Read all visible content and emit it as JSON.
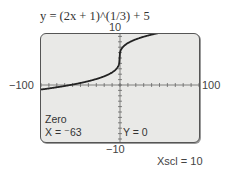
{
  "chart_data": {
    "type": "line",
    "title": "y = (2x + 1)^(1/3) + 5",
    "function": "y = (2x + 1)^(1/3) + 5",
    "xlabel": "",
    "ylabel": "",
    "xlim": [
      -100,
      100
    ],
    "ylim": [
      -10,
      10
    ],
    "xscl": 10,
    "yscl": 1,
    "grid": false,
    "axis_labels": {
      "ymax": "10",
      "ymin": "−10",
      "xmin": "−100",
      "xmax": "100"
    },
    "series": [
      {
        "name": "y = (2x + 1)^(1/3) + 5",
        "x": [
          -100,
          -90,
          -80,
          -70,
          -63,
          -50,
          -40,
          -30,
          -20,
          -10,
          -5,
          -2,
          -1,
          -0.5,
          0,
          1,
          2,
          5,
          10,
          20,
          30,
          40,
          50,
          62
        ],
        "y": [
          -0.84,
          -0.64,
          -0.42,
          -0.19,
          0,
          0.38,
          0.71,
          1.1,
          1.58,
          2.33,
          2.92,
          3.56,
          3.74,
          5,
          6,
          6.44,
          6.71,
          7.22,
          7.76,
          8.45,
          8.93,
          9.31,
          9.64,
          10
        ]
      }
    ],
    "trace": {
      "mode": "Zero",
      "x_label": "X = ",
      "x_value": "−63",
      "y_label": "Y = ",
      "y_value": "0"
    }
  },
  "header": {
    "equation": "y = (2x + 1)^(1/3) + 5"
  },
  "labels": {
    "ymax": "10",
    "ymin": "−10",
    "xmin": "−100",
    "xmax": "100",
    "xscl": "Xscl = 10"
  },
  "trace": {
    "mode": "Zero",
    "x_text": "X = ⁻63",
    "y_text": "Y = 0"
  }
}
